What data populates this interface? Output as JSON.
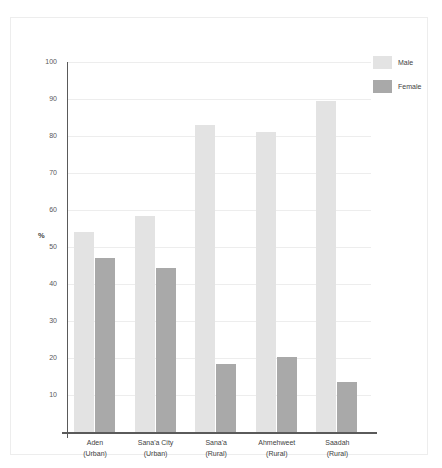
{
  "chart_data": {
    "type": "bar",
    "title": "",
    "subtitle": "",
    "xlabel": "",
    "ylabel": "%",
    "ylim": [
      0,
      100
    ],
    "yticks": [
      10,
      20,
      30,
      40,
      50,
      60,
      70,
      80,
      90,
      100
    ],
    "grid": true,
    "legend_position": "top-right",
    "categories": [
      "Aden\n(Urban)",
      "Sana'a City\n(Urban)",
      "Sana'a\n(Rural)",
      "Ahmehweet\n(Rural)",
      "Saadah\n(Rural)"
    ],
    "category_lines": [
      [
        "Aden",
        "(Urban)"
      ],
      [
        "Sana'a City",
        "(Urban)"
      ],
      [
        "Sana'a",
        "(Rural)"
      ],
      [
        "Ahmehweet",
        "(Rural)"
      ],
      [
        "Saadah",
        "(Rural)"
      ]
    ],
    "series": [
      {
        "name": "Male",
        "color": "#e3e3e3",
        "values": [
          54.0,
          58.5,
          83.0,
          81.0,
          89.5
        ]
      },
      {
        "name": "Female",
        "color": "#a9a9a9",
        "values": [
          47.0,
          44.3,
          18.5,
          20.3,
          13.5
        ]
      }
    ]
  },
  "legend": {
    "items": [
      {
        "label": "Male"
      },
      {
        "label": "Female"
      }
    ]
  },
  "axis": {
    "y_label": "%",
    "tick_labels": [
      "100",
      "90",
      "80",
      "70",
      "60",
      "50",
      "40",
      "30",
      "20",
      "10"
    ]
  }
}
